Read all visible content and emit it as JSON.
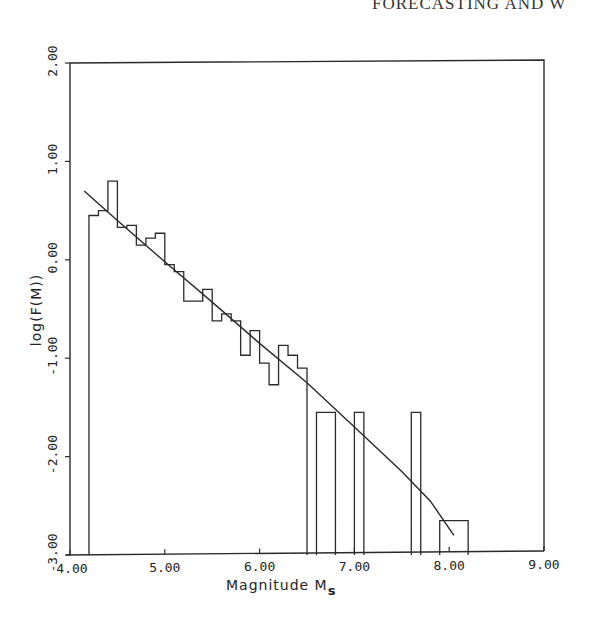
{
  "page": {
    "running_head": "FORECASTING AND W"
  },
  "chart_data": {
    "type": "bar",
    "subtype": "step-histogram-with-fit-curve",
    "title": "",
    "xlabel": "Magnitude M",
    "xlabel_subscript": "s",
    "ylabel": "log(F(M))",
    "xlim": [
      4.0,
      9.0
    ],
    "ylim": [
      -3.0,
      2.0
    ],
    "x_ticks": [
      4.0,
      5.0,
      6.0,
      7.0,
      8.0,
      9.0
    ],
    "x_tick_labels": [
      "4.00",
      "5.00",
      "6.00",
      "7.00",
      "8.00",
      "9.00"
    ],
    "y_ticks": [
      -3.0,
      -2.0,
      -1.0,
      0.0,
      1.0,
      2.0
    ],
    "y_tick_labels": [
      "-3.00",
      "-2.00",
      "-1.00",
      "0.00",
      "1.00",
      "2.00"
    ],
    "grid": false,
    "legend": null,
    "bin_width": 0.1,
    "histogram": {
      "name": "Observed log cumulative frequency",
      "bins": [
        {
          "x0": 4.2,
          "x1": 4.3,
          "value": 0.45
        },
        {
          "x0": 4.3,
          "x1": 4.4,
          "value": 0.5
        },
        {
          "x0": 4.4,
          "x1": 4.5,
          "value": 0.8
        },
        {
          "x0": 4.5,
          "x1": 4.6,
          "value": 0.33
        },
        {
          "x0": 4.6,
          "x1": 4.7,
          "value": 0.35
        },
        {
          "x0": 4.7,
          "x1": 4.8,
          "value": 0.15
        },
        {
          "x0": 4.8,
          "x1": 4.9,
          "value": 0.22
        },
        {
          "x0": 4.9,
          "x1": 5.0,
          "value": 0.27
        },
        {
          "x0": 5.0,
          "x1": 5.1,
          "value": -0.05
        },
        {
          "x0": 5.1,
          "x1": 5.2,
          "value": -0.12
        },
        {
          "x0": 5.2,
          "x1": 5.3,
          "value": -0.42
        },
        {
          "x0": 5.3,
          "x1": 5.4,
          "value": -0.42
        },
        {
          "x0": 5.4,
          "x1": 5.5,
          "value": -0.3
        },
        {
          "x0": 5.5,
          "x1": 5.6,
          "value": -0.62
        },
        {
          "x0": 5.6,
          "x1": 5.7,
          "value": -0.55
        },
        {
          "x0": 5.7,
          "x1": 5.8,
          "value": -0.62
        },
        {
          "x0": 5.8,
          "x1": 5.9,
          "value": -0.97
        },
        {
          "x0": 5.9,
          "x1": 6.0,
          "value": -0.72
        },
        {
          "x0": 6.0,
          "x1": 6.1,
          "value": -1.05
        },
        {
          "x0": 6.1,
          "x1": 6.2,
          "value": -1.27
        },
        {
          "x0": 6.2,
          "x1": 6.3,
          "value": -0.87
        },
        {
          "x0": 6.3,
          "x1": 6.4,
          "value": -0.97
        },
        {
          "x0": 6.4,
          "x1": 6.5,
          "value": -1.1
        },
        {
          "x0": 6.6,
          "x1": 6.8,
          "value": -1.55
        },
        {
          "x0": 7.0,
          "x1": 7.1,
          "value": -1.55
        },
        {
          "x0": 7.6,
          "x1": 7.7,
          "value": -1.55
        },
        {
          "x0": 7.9,
          "x1": 8.2,
          "value": -2.65
        }
      ]
    },
    "series": [
      {
        "name": "Fitted curve",
        "type": "line",
        "x": [
          4.15,
          4.5,
          5.0,
          5.5,
          6.0,
          6.5,
          7.0,
          7.5,
          7.8,
          8.05
        ],
        "values": [
          0.7,
          0.4,
          -0.02,
          -0.43,
          -0.85,
          -1.25,
          -1.7,
          -2.15,
          -2.45,
          -2.8
        ]
      }
    ]
  }
}
